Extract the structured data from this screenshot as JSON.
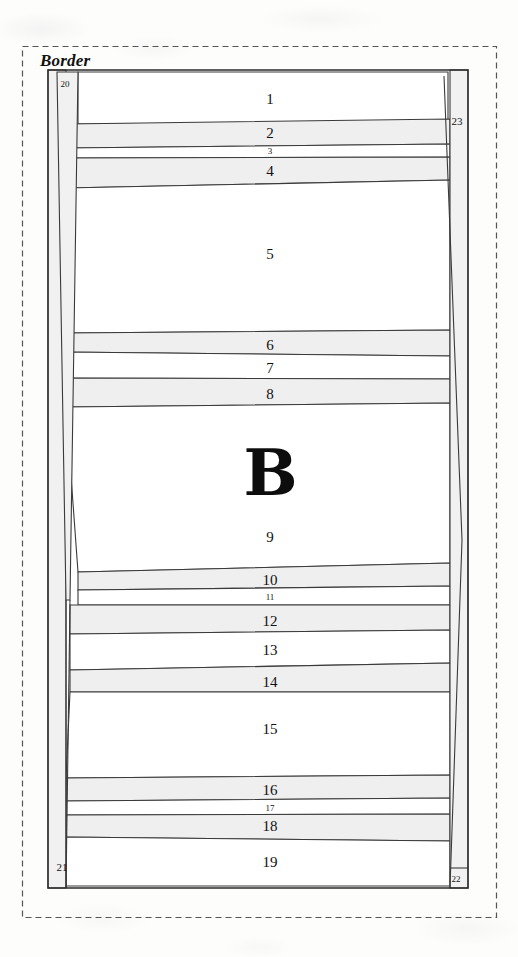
{
  "figure": {
    "title": "Border",
    "main_letter": "B",
    "colors": {
      "ink": "#1b1b1b",
      "band_fill": "#efefef",
      "strip_fill": "#f1f1f1",
      "white_fill": "#ffffff",
      "dashed_border": "#555555",
      "paper": "#fdfdfc"
    },
    "dashed_frame": {
      "x": 22,
      "y": 46,
      "width": 475,
      "height": 872
    },
    "panel": {
      "x": 48,
      "y": 70,
      "width": 420,
      "height": 818
    },
    "bands": [
      {
        "id": "1",
        "label": "1",
        "shaded": false,
        "size": "big",
        "cx": 270,
        "cy": 99
      },
      {
        "id": "2",
        "label": "2",
        "shaded": true,
        "size": "big",
        "cx": 270,
        "cy": 133
      },
      {
        "id": "3",
        "label": "3",
        "shaded": false,
        "size": "small",
        "cx": 270,
        "cy": 151
      },
      {
        "id": "4",
        "label": "4",
        "shaded": true,
        "size": "big",
        "cx": 270,
        "cy": 171
      },
      {
        "id": "5",
        "label": "5",
        "shaded": false,
        "size": "big",
        "cx": 270,
        "cy": 254
      },
      {
        "id": "6",
        "label": "6",
        "shaded": true,
        "size": "big",
        "cx": 270,
        "cy": 345
      },
      {
        "id": "7",
        "label": "7",
        "shaded": false,
        "size": "big",
        "cx": 270,
        "cy": 368
      },
      {
        "id": "8",
        "label": "8",
        "shaded": true,
        "size": "big",
        "cx": 270,
        "cy": 394
      },
      {
        "id": "9",
        "label": "9",
        "shaded": false,
        "size": "big",
        "cx": 270,
        "cy": 537
      },
      {
        "id": "10",
        "label": "10",
        "shaded": true,
        "size": "big",
        "cx": 270,
        "cy": 580
      },
      {
        "id": "11",
        "label": "11",
        "shaded": false,
        "size": "small",
        "cx": 270,
        "cy": 597
      },
      {
        "id": "12",
        "label": "12",
        "shaded": true,
        "size": "big",
        "cx": 270,
        "cy": 621
      },
      {
        "id": "13",
        "label": "13",
        "shaded": false,
        "size": "big",
        "cx": 270,
        "cy": 650
      },
      {
        "id": "14",
        "label": "14",
        "shaded": true,
        "size": "big",
        "cx": 270,
        "cy": 682
      },
      {
        "id": "15",
        "label": "15",
        "shaded": false,
        "size": "big",
        "cx": 270,
        "cy": 729
      },
      {
        "id": "16",
        "label": "16",
        "shaded": true,
        "size": "big",
        "cx": 270,
        "cy": 790
      },
      {
        "id": "17",
        "label": "17",
        "shaded": false,
        "size": "small",
        "cx": 270,
        "cy": 808
      },
      {
        "id": "18",
        "label": "18",
        "shaded": true,
        "size": "big",
        "cx": 270,
        "cy": 826
      },
      {
        "id": "19",
        "label": "19",
        "shaded": false,
        "size": "big",
        "cx": 270,
        "cy": 862
      }
    ],
    "edge_strips": [
      {
        "id": "20",
        "label": "20",
        "position": "top-left",
        "cx": 65,
        "cy": 84,
        "size": "edge-sm"
      },
      {
        "id": "21",
        "label": "21",
        "position": "bottom-left",
        "cx": 62,
        "cy": 867,
        "size": "edge"
      },
      {
        "id": "22",
        "label": "22",
        "position": "bottom-right",
        "cx": 456,
        "cy": 879,
        "size": "edge-sm"
      },
      {
        "id": "23",
        "label": "23",
        "position": "top-right",
        "cx": 457,
        "cy": 121,
        "size": "edge"
      }
    ],
    "letter_position": {
      "cx": 270,
      "cy": 472
    }
  }
}
